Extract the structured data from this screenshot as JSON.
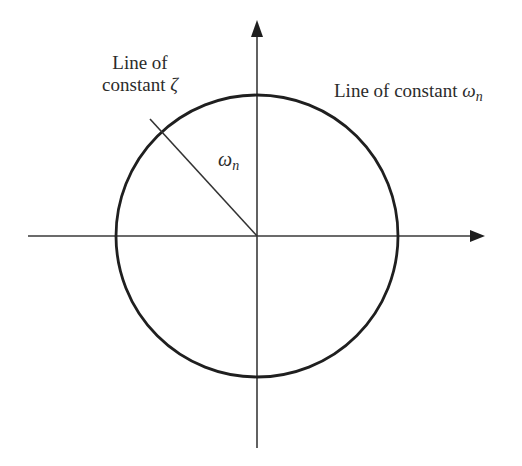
{
  "diagram": {
    "title": "",
    "type": "s-plane circle of constant natural frequency",
    "axes": {
      "horizontal": {
        "from": [
          28,
          236
        ],
        "to": [
          484,
          236
        ],
        "arrow": true
      },
      "vertical": {
        "from": [
          257,
          448
        ],
        "to": [
          257,
          20
        ],
        "arrow": true
      }
    },
    "circle": {
      "center": [
        257,
        236
      ],
      "radius": 141
    },
    "radial_line": {
      "from": [
        150,
        119
      ],
      "to": [
        257,
        236
      ]
    },
    "stroke_color": "#2a2a2a",
    "labels": {
      "zeta_line_1": "Line of",
      "zeta_line_2_prefix": "constant ",
      "zeta_symbol": "ζ",
      "wn_prefix": "Line of constant ",
      "wn_symbol": "ω",
      "wn_subscript": "n",
      "radius_symbol": "ω",
      "radius_subscript": "n"
    }
  }
}
